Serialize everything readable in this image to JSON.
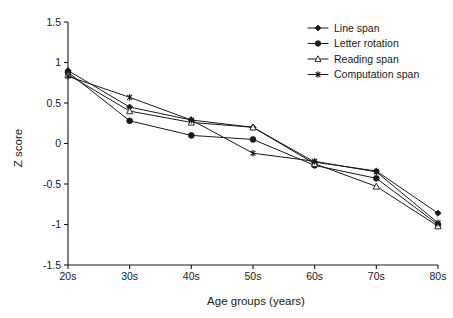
{
  "chart_data": {
    "type": "line",
    "title": "",
    "xlabel": "Age groups (years)",
    "ylabel": "Z score",
    "categories": [
      "20s",
      "30s",
      "40s",
      "50s",
      "60s",
      "70s",
      "80s"
    ],
    "ylim": [
      -1.5,
      1.5
    ],
    "yticks": [
      "1.5",
      "1",
      "0.5",
      "0",
      "-0.5",
      "-1",
      "-1.5"
    ],
    "ytick_values": [
      1.5,
      1,
      0.5,
      0,
      -0.5,
      -1,
      -1.5
    ],
    "grid": false,
    "legend_position": "top-right",
    "series": [
      {
        "name": "Line span",
        "marker": "filled-diamond",
        "values": [
          0.9,
          0.45,
          0.29,
          0.2,
          -0.23,
          -0.34,
          -0.86
        ]
      },
      {
        "name": "Letter rotation",
        "marker": "filled-circle",
        "values": [
          0.88,
          0.28,
          0.1,
          0.05,
          -0.27,
          -0.43,
          -1.0
        ]
      },
      {
        "name": "Reading span",
        "marker": "open-triangle",
        "values": [
          0.85,
          0.4,
          0.26,
          0.2,
          -0.25,
          -0.53,
          -1.02
        ]
      },
      {
        "name": "Computation span",
        "marker": "asterisk",
        "values": [
          0.83,
          0.57,
          0.29,
          -0.12,
          -0.22,
          -0.35,
          -0.98
        ]
      }
    ],
    "colors": {
      "line": "#1a1a1a",
      "background": "#ffffff",
      "axis": "#1a1a1a"
    }
  }
}
